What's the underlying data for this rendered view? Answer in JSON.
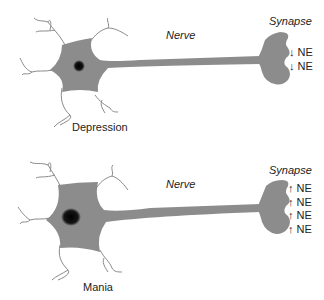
{
  "panels": [
    {
      "name": "depression",
      "caption": "Depression",
      "nerve_label": "Nerve",
      "synapse_label": "Synapse",
      "ne_items": [
        "↓ NE",
        "↓ NE"
      ],
      "direction": "decrease"
    },
    {
      "name": "mania",
      "caption": "Mania",
      "nerve_label": "Nerve",
      "synapse_label": "Synapse",
      "ne_items": [
        "↑ NE",
        "↑ NE",
        "↑ NE",
        "↑ NE"
      ],
      "direction": "increase"
    }
  ],
  "colors": {
    "cell_fill": "#8c8c8c",
    "nucleus": "#111111",
    "dendrite": "#888888",
    "text": "#222222"
  }
}
